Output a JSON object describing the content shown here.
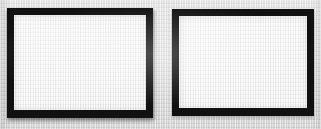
{
  "figure": {
    "width": 321,
    "height": 129,
    "background_color": "#d9d9d9"
  },
  "panels": [
    {
      "name": "left-panel",
      "frame_color": "#111111",
      "fill_color": "#ececec",
      "content": "",
      "x": 7,
      "y": 8,
      "width": 146,
      "height": 110,
      "border_width": 7
    },
    {
      "name": "right-panel",
      "frame_color": "#111111",
      "fill_color": "#ececec",
      "content": "",
      "x": 172,
      "y": 9,
      "width": 142,
      "height": 107,
      "border_width": 7
    }
  ]
}
